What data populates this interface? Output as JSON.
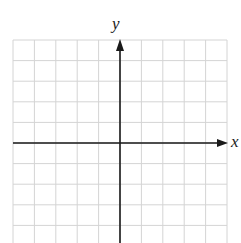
{
  "diagram": {
    "type": "coordinate-grid",
    "x_axis_label": "x",
    "y_axis_label": "y",
    "grid": {
      "left": 13,
      "top": 40,
      "columns": 10,
      "rows_above_axis": 5,
      "rows_below_axis": 5,
      "cell_width": 21.4,
      "cell_height": 20.6
    },
    "origin": {
      "x": 120,
      "y": 143
    },
    "colors": {
      "grid_line": "#d4d4d4",
      "axis": "#1a1a1a",
      "background": "#ffffff"
    }
  }
}
